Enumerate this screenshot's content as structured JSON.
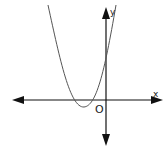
{
  "diagram": {
    "type": "coordinate-plane-parabola",
    "labels": {
      "x_axis": "x",
      "y_axis": "y",
      "origin": "O"
    },
    "curve": "upward-opening parabola with vertex below x-axis left of origin, crossing x-axis twice on negative side and y-axis above origin",
    "colors": {
      "axis": "#111111",
      "curve": "#555555",
      "background": "#ffffff"
    }
  }
}
